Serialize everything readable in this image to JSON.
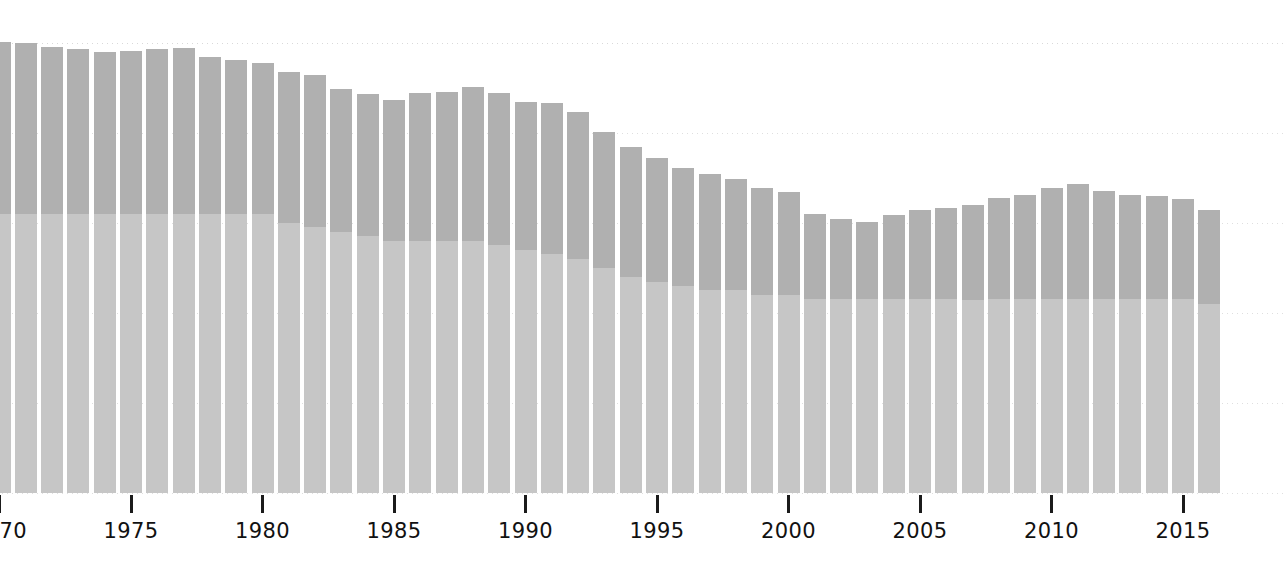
{
  "chart_data": {
    "type": "bar",
    "subtype": "stacked-bar",
    "title": "",
    "subtitle": "",
    "xlabel": "",
    "ylabel": "",
    "grid": true,
    "legend": false,
    "legend_position": "none",
    "note": "Stacked bar chart, two stacked segments per year. Left edge of the image is cropped mid-bar; the first tick label is clipped. Y axis has no tick labels, only horizontal dotted gridlines.",
    "axis": {
      "x_range": [
        1964,
        2016
      ],
      "y_range": [
        0,
        100
      ],
      "y_gridline_values": [
        100,
        80,
        60,
        40,
        20,
        0
      ],
      "y_gridline_pixels": [
        43,
        133,
        223,
        313,
        403,
        493
      ],
      "baseline_pixel": 493,
      "pixels_per_year": 26.3,
      "bar_width_px": 22
    },
    "x_tick_labels": [
      "1970",
      "1975",
      "1980",
      "1985",
      "1990",
      "1995",
      "2000",
      "2005",
      "2010",
      "2015"
    ],
    "x_tick_years": [
      1970,
      1975,
      1980,
      1985,
      1990,
      1995,
      2000,
      2005,
      2010,
      2015
    ],
    "clipped_left_label": "5",
    "categories": [
      1964,
      1965,
      1966,
      1967,
      1968,
      1969,
      1970,
      1971,
      1972,
      1973,
      1974,
      1975,
      1976,
      1977,
      1978,
      1979,
      1980,
      1981,
      1982,
      1983,
      1984,
      1985,
      1986,
      1987,
      1988,
      1989,
      1990,
      1991,
      1992,
      1993,
      1994,
      1995,
      1996,
      1997,
      1998,
      1999,
      2000,
      2001,
      2002,
      2003,
      2004,
      2005,
      2006,
      2007,
      2008,
      2009,
      2010,
      2011,
      2012,
      2013,
      2014,
      2015,
      2016
    ],
    "series": [
      {
        "name": "lower-segment",
        "color": "#c6c6c6",
        "values": [
          62.0,
          62.0,
          62.0,
          62.0,
          62.0,
          62.0,
          62.0,
          62.0,
          62.0,
          62.0,
          62.0,
          62.0,
          62.0,
          62.0,
          62.0,
          62.0,
          62.0,
          60.0,
          59.0,
          58.0,
          57.0,
          56.0,
          56.0,
          56.0,
          56.0,
          55.0,
          54.0,
          53.0,
          52.0,
          50.0,
          48.0,
          47.0,
          46.0,
          45.0,
          45.0,
          44.0,
          44.0,
          43.0,
          43.0,
          43.0,
          43.0,
          43.0,
          43.0,
          43.0,
          43.0,
          43.0,
          43.0,
          43.0,
          43.0,
          43.0,
          43.0,
          43.0,
          42.0
        ]
      },
      {
        "name": "upper-segment",
        "color": "#b0b0b0",
        "values": [
          38.0,
          38.2,
          38.3,
          37.8,
          36.7,
          37.4,
          38.2,
          38.1,
          37.2,
          36.6,
          36.0,
          36.3,
          36.6,
          37.0,
          35.0,
          34.3,
          33.5,
          33.6,
          33.8,
          31.8,
          31.6,
          31.3,
          32.8,
          33.1,
          34.2,
          33.9,
          32.8,
          33.7,
          32.6,
          30.3,
          29.0,
          27.5,
          26.3,
          25.8,
          24.8,
          23.7,
          22.8,
          18.9,
          17.9,
          17.3,
          18.7,
          19.8,
          20.3,
          21.0,
          22.6,
          23.3,
          24.8,
          25.6,
          24.1,
          23.2,
          23.1,
          22.4,
          20.8
        ]
      }
    ],
    "totals": [
      100.0,
      100.2,
      100.3,
      99.8,
      98.7,
      99.4,
      100.2,
      100.1,
      99.2,
      98.6,
      98.0,
      98.3,
      98.6,
      99.0,
      97.0,
      96.3,
      95.5,
      93.6,
      92.8,
      89.8,
      88.6,
      87.3,
      88.8,
      89.1,
      90.2,
      88.9,
      86.8,
      86.7,
      84.6,
      80.3,
      77.0,
      74.5,
      72.3,
      70.8,
      69.8,
      67.7,
      66.8,
      61.9,
      60.9,
      60.3,
      61.7,
      62.8,
      63.3,
      64.0,
      65.6,
      66.3,
      67.8,
      68.6,
      67.1,
      66.2,
      66.1,
      65.4,
      62.8
    ]
  },
  "colors": {
    "background": "#ffffff",
    "segment_upper": "#b0b0b0",
    "segment_lower": "#c6c6c6",
    "gridline": "#d9d9d9",
    "tick": "#1b1b1b",
    "tick_label": "#111111"
  }
}
